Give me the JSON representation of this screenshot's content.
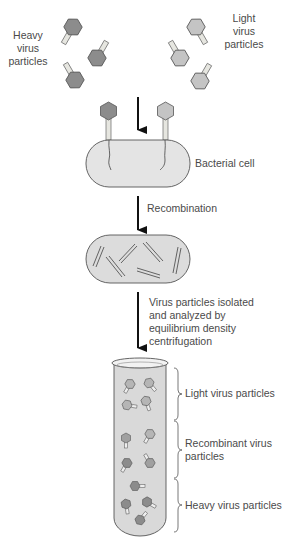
{
  "diagram": {
    "title_labels": {
      "heavy": "Heavy virus particles",
      "heavy_lines": [
        "Heavy",
        "virus",
        "particles"
      ],
      "light_lines": [
        "Light",
        "virus",
        "particles"
      ]
    },
    "steps": {
      "bacterial_cell": "Bacterial cell",
      "recombination": "Recombination",
      "isolation_lines": [
        "Virus particles isolated",
        "and analyzed by",
        "equilibrium density",
        "centrifugation"
      ]
    },
    "tube_bands": [
      {
        "label_lines": [
          "Light virus particles"
        ]
      },
      {
        "label_lines": [
          "Recombinant virus",
          "particles"
        ]
      },
      {
        "label_lines": [
          "Heavy virus particles"
        ]
      }
    ],
    "colors": {
      "heavy_virus": "#8c8c8c",
      "light_virus": "#c4c4c4",
      "tail": "#e6e6e0",
      "cell_fill": "#e4e4e4",
      "tube_fill": "#d9d9d9",
      "outline": "#555555",
      "arrow": "#111111",
      "text": "#4a4a4a"
    }
  }
}
